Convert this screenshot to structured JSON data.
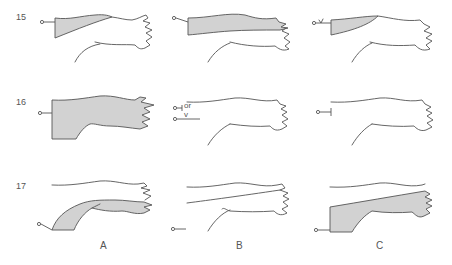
{
  "figure": {
    "rows": [
      {
        "label": "15"
      },
      {
        "label": "16"
      },
      {
        "label": "17"
      }
    ],
    "columns": [
      {
        "label": "A"
      },
      {
        "label": "B"
      },
      {
        "label": "C"
      }
    ],
    "annotations": {
      "row16_colB_or": "or",
      "row16_colB_v": "v",
      "row15_colC_v": "v"
    },
    "colors": {
      "shade": "#d2d2d2",
      "line": "#555555"
    }
  }
}
